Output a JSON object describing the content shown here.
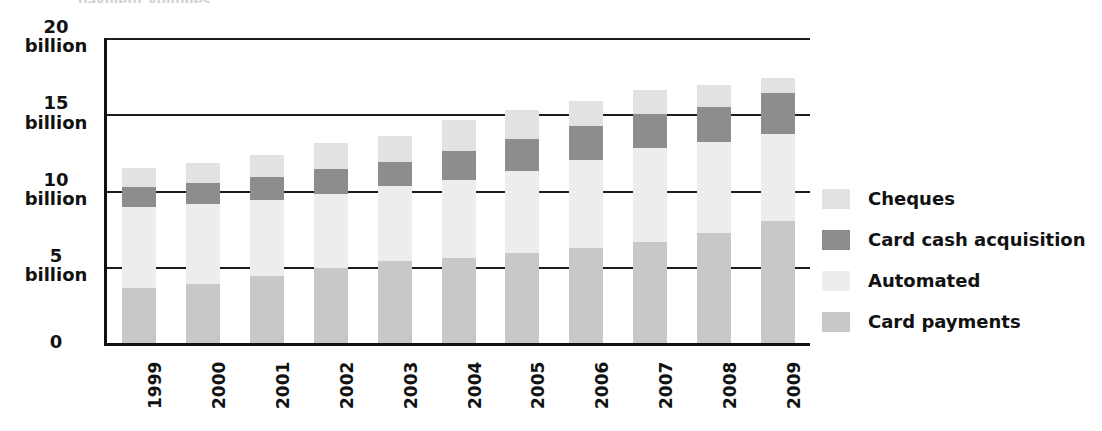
{
  "cropped_title": "payment volumes",
  "chart_data": {
    "type": "bar",
    "subtype": "stacked-vertical",
    "title": "",
    "xlabel": "",
    "ylabel": "",
    "ylim": [
      0,
      20
    ],
    "grid": true,
    "grid_axis": "y",
    "legend_position": "right",
    "categories": [
      "1999",
      "2000",
      "2001",
      "2002",
      "2003",
      "2004",
      "2005",
      "2006",
      "2007",
      "2008",
      "2009"
    ],
    "y_ticks": [
      0,
      5,
      10,
      15,
      20
    ],
    "y_tick_labels": [
      "0",
      "5\nbillion",
      "10\nbillion",
      "15\nbillion",
      "20\nbillion"
    ],
    "stack_order_bottom_to_top": [
      "Card payments",
      "Automated",
      "Card cash acquisition",
      "Cheques"
    ],
    "series": [
      {
        "name": "Card payments",
        "color": "#c8c8c8",
        "values": [
          3.6,
          3.9,
          4.4,
          4.9,
          5.4,
          5.6,
          5.9,
          6.2,
          6.6,
          7.2,
          8.0
        ]
      },
      {
        "name": "Automated",
        "color": "#ededed",
        "values": [
          5.3,
          5.2,
          5.0,
          4.9,
          4.9,
          5.1,
          5.4,
          5.8,
          6.2,
          6.0,
          5.7
        ]
      },
      {
        "name": "Card cash acquisition",
        "color": "#8d8d8d",
        "values": [
          1.3,
          1.4,
          1.5,
          1.6,
          1.6,
          1.9,
          2.1,
          2.2,
          2.2,
          2.3,
          2.7
        ]
      },
      {
        "name": "Cheques",
        "color": "#e2e2e2",
        "values": [
          1.3,
          1.3,
          1.4,
          1.7,
          1.7,
          2.0,
          1.9,
          1.7,
          1.6,
          1.4,
          1.0
        ]
      }
    ],
    "totals": [
      11.5,
      11.8,
      12.3,
      13.1,
      13.6,
      14.6,
      15.3,
      15.9,
      16.6,
      16.9,
      17.4
    ]
  },
  "y_axis": {
    "ticks": [
      {
        "value": 20,
        "line1": "20",
        "line2": "billion"
      },
      {
        "value": 15,
        "line1": "15",
        "line2": "billion"
      },
      {
        "value": 10,
        "line1": "10",
        "line2": "billion"
      },
      {
        "value": 5,
        "line1": "5",
        "line2": "billion"
      },
      {
        "value": 0,
        "line1": "0",
        "line2": ""
      }
    ]
  },
  "legend": {
    "items": [
      {
        "label": "Cheques",
        "color": "#e2e2e2"
      },
      {
        "label": "Card cash acquisition",
        "color": "#8d8d8d"
      },
      {
        "label": "Automated",
        "color": "#ededed"
      },
      {
        "label": "Card payments",
        "color": "#c8c8c8"
      }
    ]
  },
  "colors": {
    "axis": "#111111",
    "gridline": "#1d1d1d",
    "background": "#ffffff",
    "text": "#111111"
  }
}
